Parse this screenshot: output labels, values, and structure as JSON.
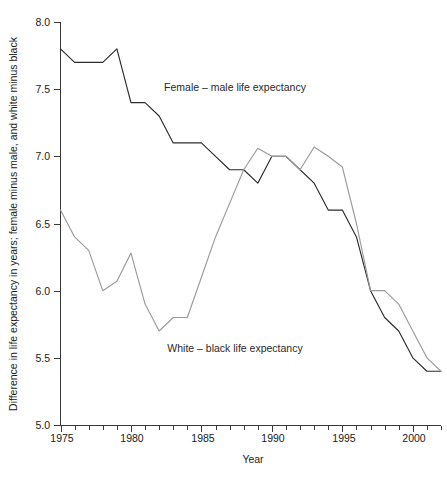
{
  "chart_data": {
    "type": "line",
    "title": "",
    "xlabel": "Year",
    "ylabel": "Difference in life expectancy in years; female minus male, and white minus black",
    "xlim": [
      1975,
      2002
    ],
    "ylim": [
      5.0,
      8.0
    ],
    "grid": false,
    "legend": "inline-annotations",
    "x_ticks_major": [
      1975,
      1980,
      1985,
      1990,
      1995,
      2000
    ],
    "x_tick_labels": [
      "1975",
      "1980",
      "1985",
      "1990",
      "1995",
      "2000"
    ],
    "x_ticks_minor": [
      1976,
      1977,
      1978,
      1979,
      1981,
      1982,
      1983,
      1984,
      1986,
      1987,
      1988,
      1989,
      1991,
      1992,
      1993,
      1994,
      1996,
      1997,
      1998,
      1999,
      2001,
      2002
    ],
    "y_ticks": [
      5.0,
      5.5,
      6.0,
      6.5,
      7.0,
      7.5,
      8.0
    ],
    "y_tick_labels": [
      "5.0",
      "5.5",
      "6.0",
      "6.5",
      "7.0",
      "7.5",
      "8.0"
    ],
    "x": [
      1975,
      1976,
      1977,
      1978,
      1979,
      1980,
      1981,
      1982,
      1983,
      1984,
      1985,
      1986,
      1987,
      1988,
      1989,
      1990,
      1991,
      1992,
      1993,
      1994,
      1995,
      1996,
      1997,
      1998,
      1999,
      2000,
      2001,
      2002
    ],
    "series": [
      {
        "name": "Female - male life expectancy",
        "annotation": "Female – male life expectancy",
        "color": "#2b2b2b",
        "values": [
          7.8,
          7.7,
          7.7,
          7.7,
          7.8,
          7.4,
          7.4,
          7.3,
          7.1,
          7.1,
          7.1,
          7.0,
          6.9,
          6.9,
          6.8,
          7.0,
          7.0,
          6.9,
          6.8,
          6.6,
          6.6,
          6.4,
          6.0,
          5.8,
          5.7,
          5.5,
          5.4,
          5.4
        ]
      },
      {
        "name": "White - black life expectancy",
        "annotation": "White – black life expectancy",
        "color": "#9a9a9a",
        "values": [
          6.6,
          6.4,
          6.3,
          6.0,
          6.07,
          6.28,
          5.9,
          5.7,
          5.8,
          5.8,
          6.1,
          6.4,
          6.65,
          6.9,
          7.06,
          7.0,
          7.0,
          6.9,
          7.07,
          7.0,
          6.92,
          6.5,
          6.0,
          6.0,
          5.9,
          5.7,
          5.5,
          5.4
        ]
      }
    ]
  },
  "axis": {
    "y_title": "Difference in life expectancy in years; female minus male, and white minus black",
    "x_title": "Year"
  },
  "annotations": {
    "female_male": "Female – male life expectancy",
    "white_black": "White – black life expectancy"
  }
}
